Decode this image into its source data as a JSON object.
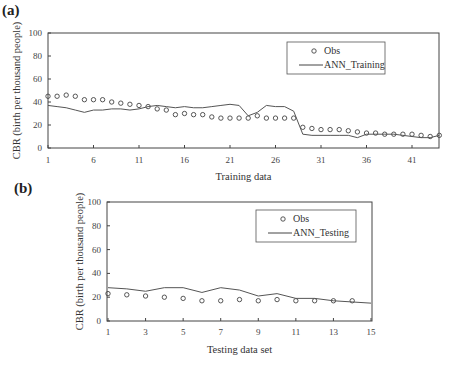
{
  "panels": {
    "a": {
      "label": "(a)"
    },
    "b": {
      "label": "(b)"
    }
  },
  "chart_data": [
    {
      "id": "a",
      "type": "line",
      "title": "(a)",
      "xlabel": "Training data",
      "ylabel": "CBR (birth per thousand people)",
      "xlim": [
        1,
        44
      ],
      "ylim": [
        0,
        100
      ],
      "xticks": [
        1,
        6,
        11,
        16,
        21,
        26,
        31,
        36,
        41
      ],
      "yticks": [
        0,
        20,
        40,
        60,
        80,
        100
      ],
      "grid": false,
      "legend_position": "upper right",
      "x": [
        1,
        2,
        3,
        4,
        5,
        6,
        7,
        8,
        9,
        10,
        11,
        12,
        13,
        14,
        15,
        16,
        17,
        18,
        19,
        20,
        21,
        22,
        23,
        24,
        25,
        26,
        27,
        28,
        29,
        30,
        31,
        32,
        33,
        34,
        35,
        36,
        37,
        38,
        39,
        40,
        41,
        42,
        43,
        44
      ],
      "series": [
        {
          "name": "Obs",
          "style": "markers-circle",
          "values": [
            45,
            45,
            46,
            45,
            42,
            42,
            42,
            40,
            39,
            38,
            37,
            36,
            34,
            33,
            29,
            30,
            29,
            29,
            27,
            26,
            26,
            26,
            26,
            28,
            26,
            26,
            26,
            26,
            18,
            17,
            16,
            16,
            16,
            15,
            14,
            13,
            13,
            12,
            12,
            12,
            12,
            11,
            10,
            11
          ]
        },
        {
          "name": "ANN_Training",
          "style": "line",
          "values": [
            37,
            36,
            35,
            33,
            31,
            33,
            33,
            34,
            34,
            33,
            34,
            36,
            37,
            36,
            35,
            36,
            35,
            35,
            36,
            37,
            38,
            37,
            28,
            31,
            37,
            36,
            36,
            32,
            12,
            11,
            11,
            11,
            11,
            11,
            9,
            12,
            12,
            12,
            12,
            11,
            10,
            9,
            9,
            11
          ]
        }
      ]
    },
    {
      "id": "b",
      "type": "line",
      "title": "(b)",
      "xlabel": "Testing data set",
      "ylabel": "CBR (birth per thousand people)",
      "xlim": [
        1,
        15
      ],
      "ylim": [
        0,
        100
      ],
      "xticks": [
        1,
        3,
        5,
        7,
        9,
        11,
        13,
        15
      ],
      "yticks": [
        0,
        20,
        40,
        60,
        80,
        100
      ],
      "grid": false,
      "legend_position": "upper right",
      "series": [
        {
          "name": "Obs",
          "style": "markers-circle",
          "x": [
            1,
            2,
            3,
            4,
            5,
            6,
            7,
            8,
            9,
            10,
            11,
            12,
            13,
            14
          ],
          "values": [
            23,
            22,
            21,
            20,
            19,
            17,
            17,
            18,
            17,
            18,
            17,
            17,
            17,
            17
          ]
        },
        {
          "name": "ANN_Testing",
          "style": "line",
          "x": [
            1,
            2,
            3,
            4,
            5,
            6,
            7,
            8,
            9,
            10,
            11,
            12,
            13,
            14,
            15
          ],
          "values": [
            28,
            27,
            25,
            28,
            28,
            24,
            28,
            26,
            21,
            23,
            19,
            19,
            17,
            16,
            15
          ]
        }
      ]
    }
  ]
}
